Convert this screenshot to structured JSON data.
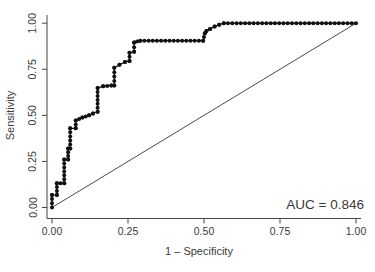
{
  "figure": {
    "auc_label": "AUC = 0.846"
  },
  "chart_data": {
    "type": "line",
    "title": "",
    "xlabel": "1 – Specificity",
    "ylabel": "Sensitivity",
    "xlim": [
      0,
      1
    ],
    "ylim": [
      0,
      1
    ],
    "grid": false,
    "legend": "none",
    "auc": 0.846,
    "annotations": [
      {
        "text": "AUC = 0.846"
      }
    ],
    "x_ticks": {
      "values": [
        0,
        0.25,
        0.5,
        0.75,
        1
      ],
      "labels": [
        "0.00",
        "0.25",
        "0.50",
        "0.75",
        "1.00"
      ]
    },
    "y_ticks": {
      "values": [
        0,
        0.25,
        0.5,
        0.75,
        1
      ],
      "labels": [
        "0.00",
        "0.25",
        "0.50",
        "0.75",
        "1.00"
      ]
    },
    "series": [
      {
        "name": "roc-curve",
        "type": "step-scatter",
        "marker": "filled-circle",
        "color": "#111111",
        "points": [
          [
            0.0,
            0.0
          ],
          [
            0.0,
            0.068
          ],
          [
            0.016,
            0.068
          ],
          [
            0.016,
            0.132
          ],
          [
            0.04,
            0.132
          ],
          [
            0.04,
            0.26
          ],
          [
            0.053,
            0.26
          ],
          [
            0.053,
            0.32
          ],
          [
            0.06,
            0.32
          ],
          [
            0.06,
            0.43
          ],
          [
            0.078,
            0.43
          ],
          [
            0.078,
            0.472
          ],
          [
            0.1,
            0.488
          ],
          [
            0.122,
            0.5
          ],
          [
            0.135,
            0.51
          ],
          [
            0.15,
            0.52
          ],
          [
            0.15,
            0.648
          ],
          [
            0.168,
            0.658
          ],
          [
            0.195,
            0.662
          ],
          [
            0.205,
            0.662
          ],
          [
            0.205,
            0.758
          ],
          [
            0.222,
            0.775
          ],
          [
            0.24,
            0.79
          ],
          [
            0.255,
            0.795
          ],
          [
            0.255,
            0.84
          ],
          [
            0.27,
            0.845
          ],
          [
            0.27,
            0.895
          ],
          [
            0.29,
            0.905
          ],
          [
            0.497,
            0.905
          ],
          [
            0.503,
            0.945
          ],
          [
            0.508,
            0.958
          ],
          [
            0.52,
            0.968
          ],
          [
            0.535,
            0.982
          ],
          [
            0.55,
            0.992
          ],
          [
            0.565,
            1.0
          ],
          [
            1.0,
            1.0
          ]
        ]
      },
      {
        "name": "chance-diagonal",
        "type": "line",
        "color": "#4a4a4a",
        "points": [
          [
            0,
            0
          ],
          [
            1,
            1
          ]
        ]
      }
    ]
  }
}
